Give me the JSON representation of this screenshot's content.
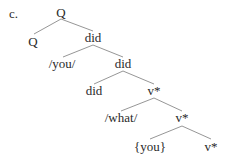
{
  "example_label": "c.",
  "tree": {
    "nodes": [
      {
        "id": "n0",
        "label": "Q"
      },
      {
        "id": "n1",
        "label": "Q"
      },
      {
        "id": "n2",
        "label": "did"
      },
      {
        "id": "n3",
        "label": "/you/"
      },
      {
        "id": "n4",
        "label": "did"
      },
      {
        "id": "n5",
        "label": "did"
      },
      {
        "id": "n6",
        "label": "v*"
      },
      {
        "id": "n7",
        "label": "/what/"
      },
      {
        "id": "n8",
        "label": "v*"
      },
      {
        "id": "n9",
        "label": "{you}"
      },
      {
        "id": "n10",
        "label": "v*"
      }
    ],
    "edges": [
      [
        "n0",
        "n1"
      ],
      [
        "n0",
        "n2"
      ],
      [
        "n2",
        "n3"
      ],
      [
        "n2",
        "n4"
      ],
      [
        "n4",
        "n5"
      ],
      [
        "n4",
        "n6"
      ],
      [
        "n6",
        "n7"
      ],
      [
        "n6",
        "n8"
      ],
      [
        "n8",
        "n9"
      ],
      [
        "n8",
        "n10"
      ]
    ]
  }
}
